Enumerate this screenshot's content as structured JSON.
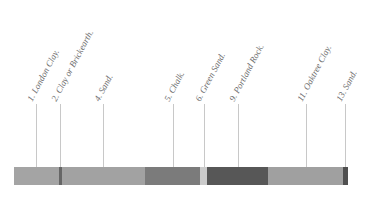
{
  "diagram": {
    "type": "geological-section-strip",
    "labels": [
      {
        "id": 1,
        "text": "1. London Clay.",
        "x": 36
      },
      {
        "id": 2,
        "text": "2. Clay or Brickearth.",
        "x": 60
      },
      {
        "id": 4,
        "text": "4. Sand.",
        "x": 103
      },
      {
        "id": 5,
        "text": "5. Chalk.",
        "x": 173
      },
      {
        "id": 6,
        "text": "6. Green Sand.",
        "x": 204
      },
      {
        "id": 9,
        "text": "9. Portland Rock.",
        "x": 238
      },
      {
        "id": 11,
        "text": "11. Oaktree Clay.",
        "x": 306
      },
      {
        "id": 13,
        "text": "13. Sand.",
        "x": 345
      }
    ],
    "segments": [
      {
        "x": 14,
        "w": 45,
        "color": "#a4a4a4"
      },
      {
        "x": 59,
        "w": 3,
        "color": "#666666"
      },
      {
        "x": 62,
        "w": 83,
        "color": "#a2a2a2"
      },
      {
        "x": 145,
        "w": 55,
        "color": "#7b7b7b"
      },
      {
        "x": 200,
        "w": 7,
        "color": "#cbcbcb"
      },
      {
        "x": 207,
        "w": 61,
        "color": "#575757"
      },
      {
        "x": 268,
        "w": 75,
        "color": "#a0a0a0"
      },
      {
        "x": 343,
        "w": 5,
        "color": "#505050"
      }
    ]
  }
}
